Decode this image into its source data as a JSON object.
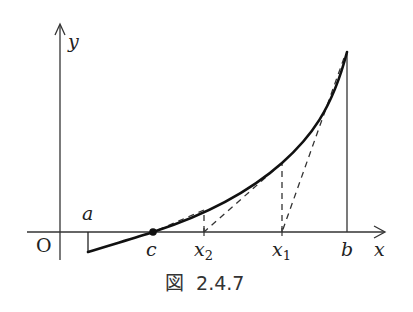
{
  "figure": {
    "caption_prefix": "図",
    "caption_number": "2.4.7",
    "labels": {
      "origin": "O",
      "x_axis": "x",
      "y_axis": "y",
      "a": "a",
      "b": "b",
      "c": "c",
      "x1_base": "x",
      "x1_sub": "1",
      "x2_base": "x",
      "x2_sub": "2"
    }
  }
}
